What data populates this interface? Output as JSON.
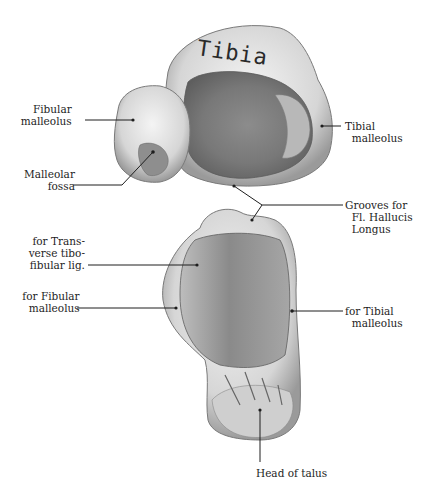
{
  "figure": {
    "title_on_bone": "Tibia",
    "upper_view": {
      "labels": {
        "fibular_malleolus": "Fibular\n  malleolus",
        "malleolar_fossa": "Malleolar\n     fossa",
        "tibial_malleolus": "Tibial\n  malleolus",
        "grooves": "Grooves for\n  Fl. Hallucis\n  Longus"
      }
    },
    "lower_view": {
      "labels": {
        "transverse_lig": "for Trans-\n  verse tibo-\n  fibular lig.",
        "fibular_malleolus": "for Fibular\n  malleolus",
        "tibial_malleolus": "for Tibial\n  malleolus",
        "head_of_talus": "Head of talus"
      }
    },
    "colors": {
      "ink": "#1e1e1e",
      "bone_light": "#e8e8e8",
      "bone_mid": "#a8a8a8",
      "bone_dark": "#6e6e6e"
    }
  }
}
